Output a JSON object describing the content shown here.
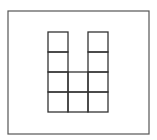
{
  "diagram": {
    "stroke_color": "#333333",
    "frame_color": "#555555",
    "frame": {
      "x": 8,
      "y": 11,
      "w": 141,
      "h": 123
    },
    "grid": {
      "origin_x": 48,
      "origin_y": 32,
      "cell": 20,
      "rows": 4,
      "cols": 3,
      "cells": [
        [
          1,
          0,
          1
        ],
        [
          1,
          0,
          1
        ],
        [
          1,
          1,
          1
        ],
        [
          1,
          1,
          1
        ]
      ]
    },
    "square_count": 10
  }
}
